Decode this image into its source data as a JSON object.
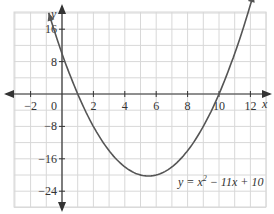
{
  "chart_data": {
    "type": "line",
    "title": "",
    "xlabel": "x",
    "ylabel": "y",
    "xlim": [
      -3,
      13
    ],
    "ylim": [
      -28,
      20
    ],
    "grid": true,
    "x_ticks": [
      "-2",
      "0",
      "2",
      "4",
      "6",
      "8",
      "10",
      "12"
    ],
    "y_ticks": [
      "16",
      "8",
      "-8",
      "-16",
      "-24"
    ],
    "series": [
      {
        "name": "y = x² − 11x + 10",
        "equation": "y = x^2 - 11x + 10",
        "x": [
          -1,
          0,
          1,
          2,
          3,
          4,
          5,
          5.5,
          6,
          7,
          8,
          9,
          10,
          11,
          12
        ],
        "y": [
          22,
          10,
          0,
          -8,
          -14,
          -18,
          -20,
          -20.25,
          -20,
          -18,
          -14,
          -8,
          0,
          10,
          22
        ]
      }
    ],
    "annotation": {
      "prefix": "y = x",
      "sup": "2",
      "suffix": " − 11x + 10"
    },
    "colors": {
      "curve": "#555555",
      "grid": "#d8d8d8",
      "axis": "#333333"
    }
  }
}
